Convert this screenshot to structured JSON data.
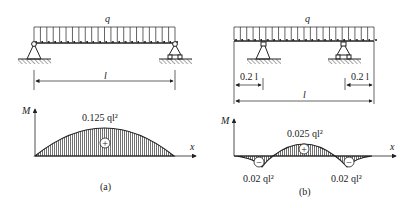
{
  "figure_a": {
    "load_label": "q",
    "span_label": "l",
    "moment_axis_label": "M",
    "x_axis_label": "x",
    "max_moment_label": "0.125 ql²",
    "sign_positive": "+",
    "caption": "(a)"
  },
  "figure_b": {
    "load_label": "q",
    "span_label": "l",
    "overhang_left_label": "0.2 l",
    "overhang_right_label": "0.2 l",
    "moment_axis_label": "M",
    "x_axis_label": "x",
    "max_positive_label": "0.025 ql²",
    "left_negative_label": "0.02 ql²",
    "right_negative_label": "0.02 ql²",
    "sign_positive": "+",
    "sign_negative": "−",
    "caption": "(b)"
  },
  "colors": {
    "line": "#222222",
    "background": "#ffffff"
  }
}
